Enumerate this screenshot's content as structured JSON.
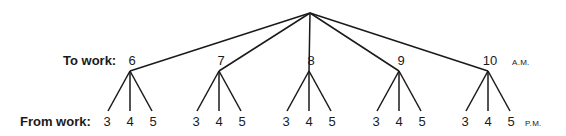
{
  "diagram": {
    "type": "tree",
    "root": {
      "x": 310,
      "y": 13
    },
    "row_labels": {
      "to_work": "To work:",
      "from_work": "From work:"
    },
    "time_suffix": {
      "am": "A.M.",
      "pm": "P.M."
    },
    "to_work_times": [
      {
        "label": "6",
        "x": 130
      },
      {
        "label": "7",
        "x": 219
      },
      {
        "label": "8",
        "x": 309
      },
      {
        "label": "9",
        "x": 399
      },
      {
        "label": "10",
        "x": 488
      }
    ],
    "from_work_times": [
      "3",
      "4",
      "5"
    ],
    "line_color": "#1a1a1a"
  }
}
